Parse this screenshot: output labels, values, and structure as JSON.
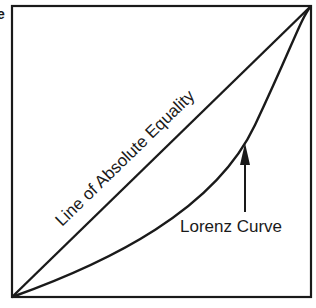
{
  "diagram": {
    "title_fragment": "e",
    "equality_line_label": "Line of Absolute Equality",
    "curve_label": "Lorenz Curve",
    "colors": {
      "ink": "#1a1a1a",
      "background": "#ffffff"
    },
    "box": {
      "left": 12,
      "top": 6,
      "right": 311,
      "bottom": 297
    }
  }
}
